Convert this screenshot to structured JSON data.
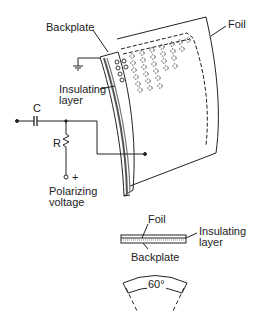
{
  "diagram": {
    "main_view": {
      "labels": {
        "backplate": "Backplate",
        "foil": "Foil",
        "insulating_line1": "Insulating",
        "insulating_line2": "layer",
        "capacitor": "C",
        "resistor": "R",
        "plus": "+",
        "polarizing_line1": "Polarizing",
        "polarizing_line2": "voltage"
      }
    },
    "cross_section": {
      "labels": {
        "foil": "Foil",
        "insulating_line1": "Insulating",
        "insulating_line2": "layer",
        "backplate": "Backplate"
      }
    },
    "angle_view": {
      "label": "60°"
    },
    "colors": {
      "line": "#222222",
      "background": "#ffffff",
      "layer_fill": "#888888"
    }
  }
}
